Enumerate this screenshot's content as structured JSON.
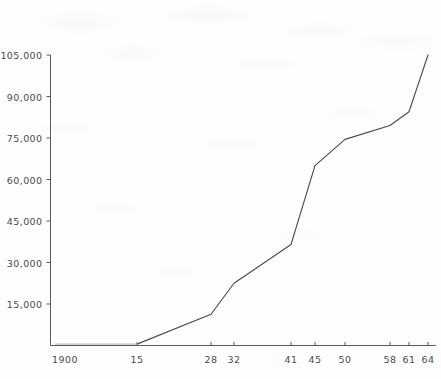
{
  "chart_data": {
    "type": "line",
    "title": "",
    "subtitle": "",
    "xlabel": "",
    "ylabel": "",
    "x_tick_labels": [
      "1900",
      "15",
      "28",
      "32",
      "41",
      "45",
      "50",
      "58",
      "61",
      "64"
    ],
    "x_tick_values": [
      1900,
      1915,
      1928,
      1932,
      1941,
      1945,
      1950,
      1958,
      1961,
      1964
    ],
    "y_tick_labels": [
      "15,000",
      "30,000",
      "45,000",
      "60,000",
      "75,000",
      "90,000",
      "105,000"
    ],
    "y_tick_values": [
      15000,
      30000,
      45000,
      60000,
      75000,
      90000,
      105000
    ],
    "ylim": [
      0,
      105000
    ],
    "xlim": [
      1900,
      1964
    ],
    "grid": false,
    "legend": null,
    "legend_position": "none",
    "series": [
      {
        "name": "series-1",
        "color": "#4a4a4a",
        "x": [
          1900,
          1915,
          1928,
          1932,
          1941,
          1945,
          1950,
          1958,
          1961,
          1964
        ],
        "values": [
          500,
          500,
          11300,
          22500,
          36500,
          65000,
          74500,
          79500,
          84500,
          105000
        ]
      }
    ],
    "annotations": []
  },
  "axes": {
    "y_axis_name": "y-axis",
    "x_axis_name": "x-axis",
    "axis_color": "#5a5a5a",
    "tick_color": "#5a5a5a",
    "label_color": "#4a4a4a"
  }
}
